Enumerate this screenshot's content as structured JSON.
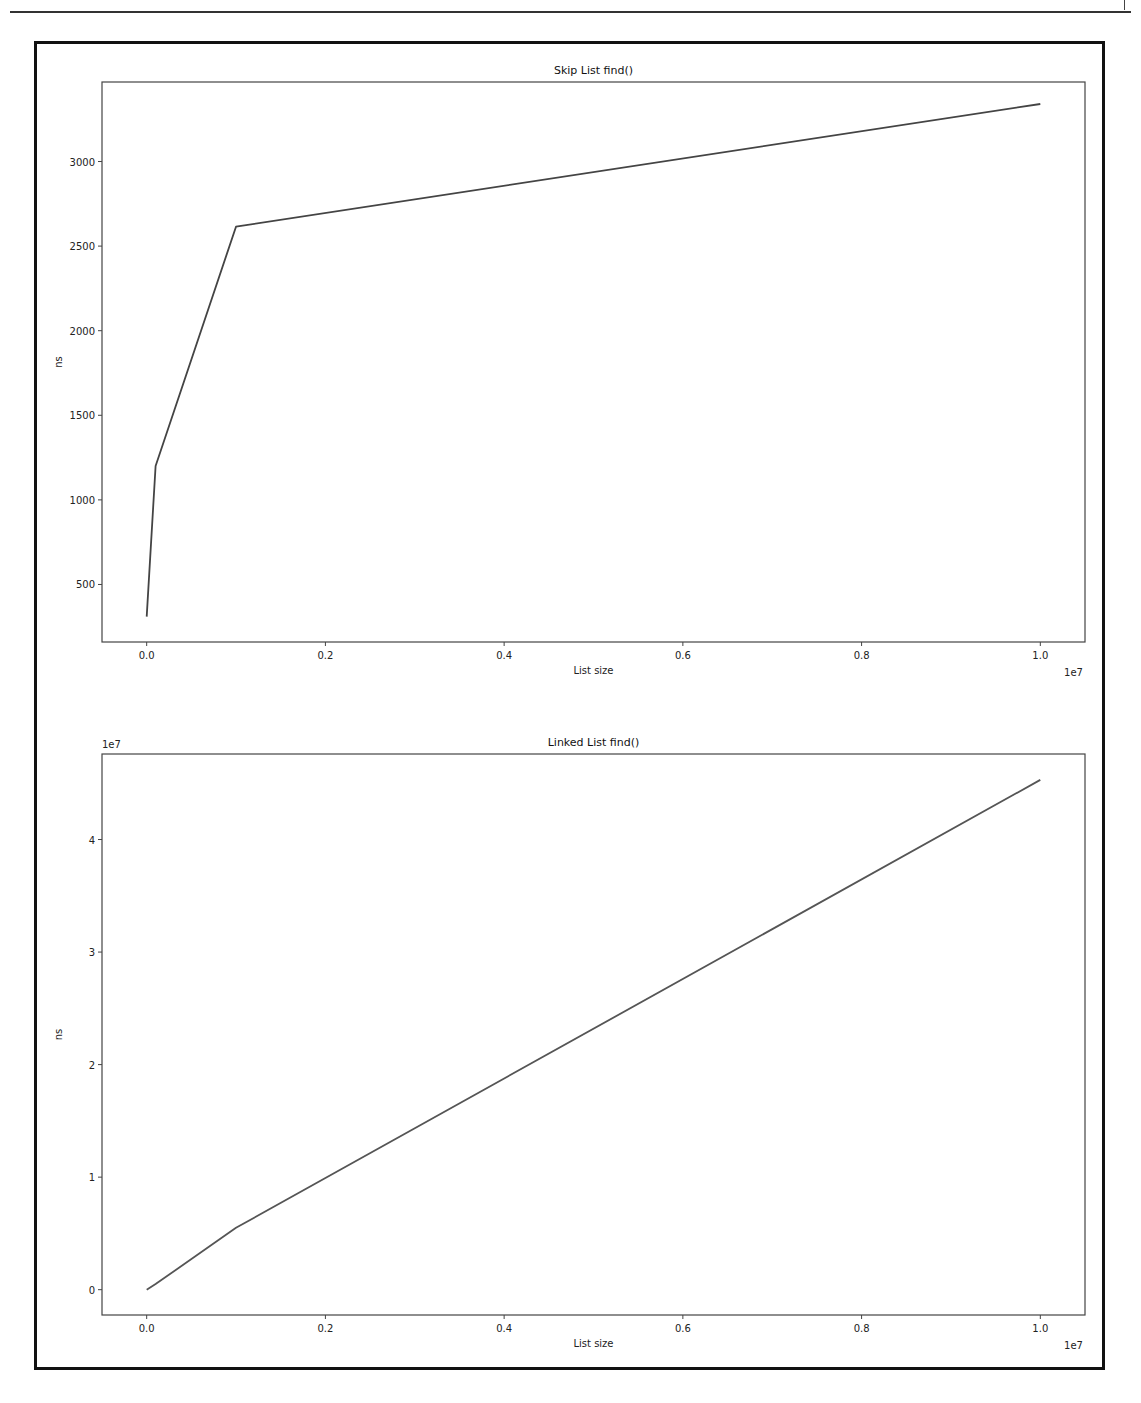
{
  "page": {
    "header_rule": true
  },
  "chart_data": [
    {
      "type": "line",
      "title": "Skip List find()",
      "xlabel": "List size",
      "ylabel": "ns",
      "x_offset_label": "1e7",
      "y_offset_label": "",
      "x": [
        0,
        100000,
        1000000,
        10000000
      ],
      "series": [
        {
          "name": "Skip List find()",
          "values": [
            310,
            1200,
            2615,
            3340
          ],
          "color": "#444444"
        }
      ],
      "xlim": [
        -500000,
        10500000
      ],
      "ylim": [
        160,
        3470
      ],
      "xticks": [
        0,
        2000000,
        4000000,
        6000000,
        8000000,
        10000000
      ],
      "xtick_labels": [
        "0.0",
        "0.2",
        "0.4",
        "0.6",
        "0.8",
        "1.0"
      ],
      "yticks": [
        500,
        1000,
        1500,
        2000,
        2500,
        3000
      ],
      "ytick_labels": [
        "500",
        "1000",
        "1500",
        "2000",
        "2500",
        "3000"
      ],
      "grid": false,
      "legend": false,
      "box": {
        "left": 102,
        "top": 82,
        "right": 1085,
        "bottom": 642
      }
    },
    {
      "type": "line",
      "title": "Linked List find()",
      "xlabel": "List size",
      "ylabel": "ns",
      "x_offset_label": "1e7",
      "y_offset_label": "1e7",
      "x": [
        0,
        100000,
        1000000,
        10000000
      ],
      "series": [
        {
          "name": "Linked List find()",
          "values": [
            0,
            500000,
            5500000,
            45300000
          ],
          "color": "#555555"
        }
      ],
      "xlim": [
        -500000,
        10500000
      ],
      "ylim": [
        -2250000,
        47600000
      ],
      "xticks": [
        0,
        2000000,
        4000000,
        6000000,
        8000000,
        10000000
      ],
      "xtick_labels": [
        "0.0",
        "0.2",
        "0.4",
        "0.6",
        "0.8",
        "1.0"
      ],
      "yticks": [
        0,
        10000000,
        20000000,
        30000000,
        40000000
      ],
      "ytick_labels": [
        "0",
        "1",
        "2",
        "3",
        "4"
      ],
      "grid": false,
      "legend": false,
      "box": {
        "left": 102,
        "top": 754,
        "right": 1085,
        "bottom": 1315
      }
    }
  ]
}
